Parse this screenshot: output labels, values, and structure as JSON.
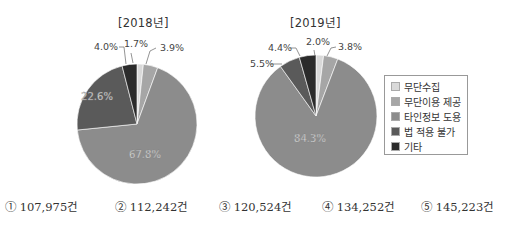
{
  "header_cut_text": "자료 1",
  "chart_data": [
    {
      "type": "pie",
      "title": "[2018년]",
      "categories": [
        "무단수집",
        "무단이용 제공",
        "타인정보 도용",
        "법 적용 불가",
        "기타"
      ],
      "values": [
        1.7,
        3.9,
        67.8,
        22.6,
        4.0
      ],
      "labels": [
        "1.7%",
        "3.9%",
        "67.8%",
        "22.6%",
        "4.0%"
      ],
      "unit": "%"
    },
    {
      "type": "pie",
      "title": "[2019년]",
      "categories": [
        "무단수집",
        "무단이용 제공",
        "타인정보 도용",
        "법 적용 불가",
        "기타"
      ],
      "values": [
        2.0,
        3.8,
        84.3,
        5.5,
        4.4
      ],
      "labels": [
        "2.0%",
        "3.8%",
        "84.3%",
        "5.5%",
        "4.4%"
      ],
      "unit": "%"
    }
  ],
  "legend": {
    "placement": "right",
    "items": [
      {
        "label": "무단수집",
        "color": "#d9d9d9"
      },
      {
        "label": "무단이용 제공",
        "color": "#a6a6a6"
      },
      {
        "label": "타인정보 도용",
        "color": "#8c8c8c"
      },
      {
        "label": "법 적용 불가",
        "color": "#5a5a5a"
      },
      {
        "label": "기타",
        "color": "#2b2b2b"
      }
    ]
  },
  "answers": [
    {
      "num": "①",
      "text": "107,975건"
    },
    {
      "num": "②",
      "text": "112,242건"
    },
    {
      "num": "③",
      "text": "120,524건"
    },
    {
      "num": "④",
      "text": "134,252건"
    },
    {
      "num": "⑤",
      "text": "145,223건"
    }
  ]
}
